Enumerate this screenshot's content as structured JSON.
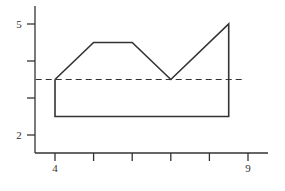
{
  "chart_data": {
    "type": "line",
    "title": "",
    "xlabel": "",
    "ylabel": "",
    "xlim": [
      3.5,
      9.3
    ],
    "ylim": [
      1.6,
      5.3
    ],
    "grid": false,
    "legend": null,
    "x_ticks": [
      4,
      5,
      6,
      7,
      8,
      9
    ],
    "x_tick_labels": [
      "4",
      "",
      "",
      "",
      "",
      "9"
    ],
    "y_ticks": [
      2,
      3,
      4,
      5
    ],
    "y_tick_labels": [
      "2",
      "",
      "",
      "5"
    ],
    "series": [
      {
        "name": "closed-polygon",
        "style": "solid",
        "color": "#333333",
        "points": [
          {
            "x": 4,
            "y": 3.5
          },
          {
            "x": 5,
            "y": 4.5
          },
          {
            "x": 6,
            "y": 4.5
          },
          {
            "x": 7,
            "y": 3.5
          },
          {
            "x": 8.5,
            "y": 5
          },
          {
            "x": 8.5,
            "y": 2.5
          },
          {
            "x": 4,
            "y": 2.5
          },
          {
            "x": 4,
            "y": 3.5
          }
        ]
      },
      {
        "name": "reference-line",
        "style": "dashed",
        "color": "#333333",
        "points": [
          {
            "x": 3.5,
            "y": 3.5
          },
          {
            "x": 8.9,
            "y": 3.5
          }
        ]
      }
    ]
  },
  "labels": {
    "y_top": "5",
    "y_bottom": "2",
    "x_left": "4",
    "x_right": "9"
  }
}
